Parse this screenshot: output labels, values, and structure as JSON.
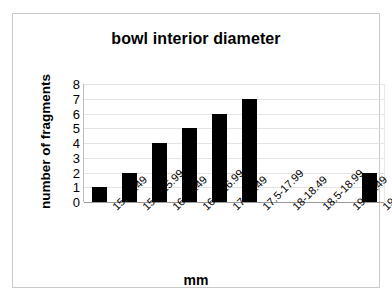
{
  "chart_data": {
    "type": "bar",
    "title": "bowl interior diameter",
    "xlabel": "mm",
    "ylabel": "number of fragments",
    "categories": [
      "15-15.49",
      "15.5-15.99",
      "16-16.49",
      "16.5-16.99",
      "17-17.49",
      "17.5-17.99",
      "18-18.49",
      "18.5-18.99",
      "19-19.49",
      "19.5-20"
    ],
    "values": [
      1,
      2,
      4,
      5,
      6,
      7,
      0,
      0,
      0,
      2
    ],
    "ylim": [
      0,
      8
    ],
    "ytick_labels": [
      "0",
      "1",
      "2",
      "3",
      "4",
      "5",
      "6",
      "7",
      "8"
    ],
    "grid": true,
    "legend": false,
    "bar_color": "#000000",
    "gridline_color": "#e4e4e4",
    "axis_color": "#9a9a9a",
    "frame_color": "#c9c9c9",
    "background": "#ffffff"
  }
}
